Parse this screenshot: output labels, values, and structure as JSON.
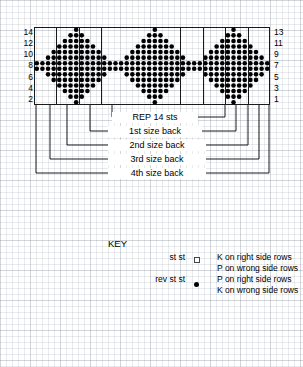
{
  "chart": {
    "grid": {
      "columns": 42,
      "rows": 14,
      "cell_width": 5.62,
      "cell_height": 5.57,
      "frame_color": "#1a1a1a"
    },
    "row_numbers_left": [
      "14",
      "12",
      "10",
      "8",
      "6",
      "4",
      "2"
    ],
    "row_numbers_right": [
      "13",
      "11",
      "9",
      "7",
      "5",
      "3",
      "1"
    ],
    "section_divider_columns": [
      4,
      8,
      12,
      26,
      30,
      34,
      38
    ],
    "motif": {
      "name": "diamond",
      "repeat_stitches": 14,
      "repeat_starts": [
        0,
        14,
        28
      ],
      "symbol_filled": "rev st st / P on right side rows",
      "symbol_empty": "st st / K on right side rows"
    }
  },
  "chart_data": {
    "type": "heatmap",
    "xlabel": "",
    "ylabel": "",
    "columns": 42,
    "rows": 14,
    "legend_position": "below",
    "grid": true,
    "row_labels_left": [
      "14",
      "12",
      "10",
      "8",
      "6",
      "4",
      "2"
    ],
    "row_labels_right": [
      "13",
      "11",
      "9",
      "7",
      "5",
      "3",
      "1"
    ],
    "note": "rows listed top (14) to bottom (1); 1 = filled purl stitch, 0 = empty knit stitch; 3 repeats of 14 stitches",
    "repeat_width": 14,
    "repeat_pattern_rows": [
      "00000001000000",
      "00000011100000",
      "00000111110000",
      "00001111111000",
      "00011111111100",
      "00111111111110",
      "11111111111111",
      "11111111111111",
      "00111111111110",
      "00011111111100",
      "00001111111000",
      "00000111110000",
      "00000011100000",
      "00000001000000"
    ]
  },
  "brackets": [
    {
      "label": "REP 14 sts",
      "span_label": "repeat-14-stitches"
    },
    {
      "label": "1st size back",
      "span_label": "first-size-back"
    },
    {
      "label": "2nd size back",
      "span_label": "second-size-back"
    },
    {
      "label": "3rd size back",
      "span_label": "third-size-back"
    },
    {
      "label": "4th size back",
      "span_label": "fourth-size-back"
    }
  ],
  "key": {
    "title": "KEY",
    "entries": [
      {
        "term": "st  st",
        "symbol": "open-square",
        "line1": "K on right side rows",
        "line2": "P on wrong side rows"
      },
      {
        "term": "rev st st",
        "symbol": "filled-dot",
        "line1": "P on right side rows",
        "line2": "K on wrong side rows"
      }
    ]
  },
  "colors": {
    "ink": "#000000",
    "frame": "#1a1a1a",
    "paper": "#ffffff",
    "graph_line": "#788291"
  }
}
